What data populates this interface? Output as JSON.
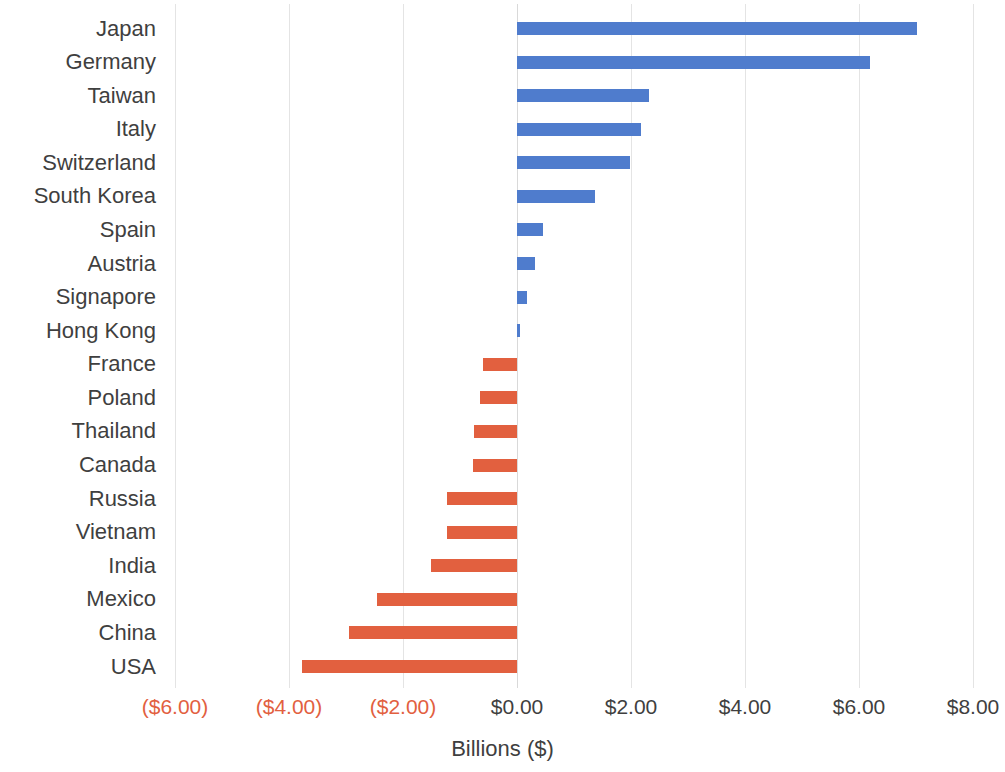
{
  "chart_data": {
    "type": "bar",
    "orientation": "horizontal",
    "title": "",
    "subtitle": "",
    "xlabel": "Billions ($)",
    "ylabel": "",
    "xlim": [
      -6.0,
      8.0
    ],
    "grid": true,
    "grid_axis": "x",
    "legend": null,
    "categories": [
      "Japan",
      "Germany",
      "Taiwan",
      "Italy",
      "Switzerland",
      "South Korea",
      "Spain",
      "Austria",
      "Signapore",
      "Hong Kong",
      "France",
      "Poland",
      "Thailand",
      "Canada",
      "Russia",
      "Vietnam",
      "India",
      "Mexico",
      "China",
      "USA"
    ],
    "values": [
      7.02,
      6.19,
      2.32,
      2.18,
      1.98,
      1.37,
      0.46,
      0.32,
      0.18,
      0.06,
      -0.6,
      -0.65,
      -0.75,
      -0.78,
      -1.22,
      -1.23,
      -1.51,
      -2.46,
      -2.95,
      -3.77
    ],
    "xticks": [
      -6,
      -4,
      -2,
      0,
      2,
      4,
      6,
      8
    ],
    "xticklabels": [
      "($6.00)",
      "($4.00)",
      "($2.00)",
      "$0.00",
      "$2.00",
      "$4.00",
      "$6.00",
      "$8.00"
    ],
    "colors": {
      "positive": "#4f7ccd",
      "negative": "#e2603f",
      "negative_tick_label": "#e2603f",
      "positive_tick_label": "#3f3f3f",
      "gridline": "#e4e4e4",
      "category_label": "#3f3f3f",
      "background": "#ffffff"
    }
  }
}
